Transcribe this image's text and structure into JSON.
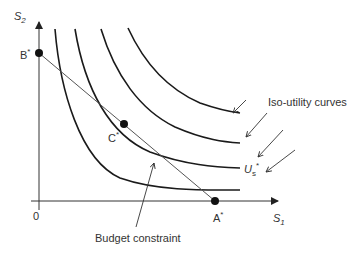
{
  "axes": {
    "y_label": "S",
    "y_sub": "2",
    "x_label": "S",
    "x_sub": "1",
    "origin": "0"
  },
  "points": {
    "b": {
      "label": "B",
      "sup": "*"
    },
    "c": {
      "label": "C",
      "sup": "*"
    },
    "a": {
      "label": "A",
      "sup": "*"
    }
  },
  "annotations": {
    "iso_utility": "Iso-utility curves",
    "budget": "Budget constraint",
    "us_label": "U",
    "us_sub": "s",
    "us_sup": "*"
  },
  "colors": {
    "line": "#1a1a1a",
    "axis": "#333333",
    "text": "#333333"
  }
}
